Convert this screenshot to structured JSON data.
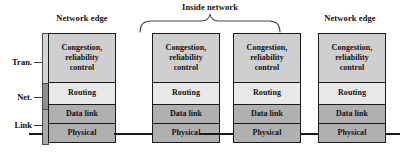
{
  "diagram": {
    "captions": {
      "edge_left": "Network edge",
      "edge_right": "Network edge",
      "inside": "Inside network"
    },
    "layer_labels": {
      "transport": "Tran.",
      "network": "Net.",
      "link": "Link"
    },
    "layer_names": {
      "transport": "Congestion,\nreliability\ncontrol",
      "network": "Routing",
      "datalink": "Data link",
      "physical": "Physical"
    },
    "stacks": [
      {
        "id": "host-left",
        "role": "network edge host",
        "has_spine": true,
        "layers": [
          {
            "name": "transport",
            "label": "Congestion,\nreliability\ncontrol",
            "fill": "#cfcfcf"
          },
          {
            "name": "network",
            "label": "Routing",
            "fill": "#e9e9e9"
          },
          {
            "name": "datalink",
            "label": "Data link",
            "fill": "#b0b0b0"
          },
          {
            "name": "physical",
            "label": "Physical",
            "fill": "#b0b0b0"
          }
        ]
      },
      {
        "id": "router-1",
        "role": "inside network",
        "has_spine": false,
        "layers": [
          {
            "name": "transport",
            "label": "Congestion,\nreliability\ncontrol",
            "fill": "#cfcfcf"
          },
          {
            "name": "network",
            "label": "Routing",
            "fill": "#e9e9e9"
          },
          {
            "name": "datalink",
            "label": "Data link",
            "fill": "#b0b0b0"
          },
          {
            "name": "physical",
            "label": "Physical",
            "fill": "#b0b0b0"
          }
        ]
      },
      {
        "id": "router-2",
        "role": "inside network",
        "has_spine": false,
        "layers": [
          {
            "name": "transport",
            "label": "Congestion,\nreliability\ncontrol",
            "fill": "#cfcfcf"
          },
          {
            "name": "network",
            "label": "Routing",
            "fill": "#e9e9e9"
          },
          {
            "name": "datalink",
            "label": "Data link",
            "fill": "#b0b0b0"
          },
          {
            "name": "physical",
            "label": "Physical",
            "fill": "#b0b0b0"
          }
        ]
      },
      {
        "id": "host-right",
        "role": "network edge host",
        "has_spine": false,
        "layers": [
          {
            "name": "transport",
            "label": "Congestion,\nreliability\ncontrol",
            "fill": "#cfcfcf"
          },
          {
            "name": "network",
            "label": "Routing",
            "fill": "#e9e9e9"
          },
          {
            "name": "datalink",
            "label": "Data link",
            "fill": "#b0b0b0"
          },
          {
            "name": "physical",
            "label": "Physical",
            "fill": "#b0b0b0"
          }
        ]
      }
    ],
    "colors": {
      "background": "#ffffff",
      "outline": "#1a1a1a",
      "text": "#111111",
      "transport_fill": "#cfcfcf",
      "network_fill": "#e9e9e9",
      "link_fill": "#b0b0b0",
      "spine_transport": "#d6d6d6",
      "spine_network": "#8e8e8e",
      "spine_link": "#a9a9a9"
    }
  }
}
